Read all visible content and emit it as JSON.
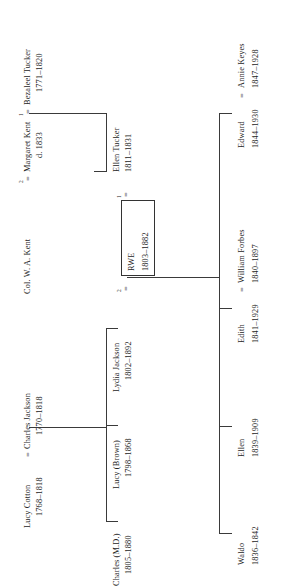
{
  "diagram": {
    "type": "genealogy-chart",
    "orientation": "rotated-90-ccw",
    "line_color": "#3a3a3a",
    "text_color": "#242424"
  },
  "people": {
    "kent": {
      "name": "Col. W. A. Kent",
      "marriage_number": "2",
      "equals": "="
    },
    "margaret_kent": {
      "name": "Margaret Kent",
      "dates": "d. 1833",
      "marriage_number": "1",
      "equals": "="
    },
    "bezaleel_tucker": {
      "name": "Bezaleel Tucker",
      "dates": "1771–1820"
    },
    "ellen_tucker": {
      "name": "Ellen Tucker",
      "dates": "1811–1831"
    },
    "rwe": {
      "name": "RWE",
      "dates": "1803–1882",
      "marriage_1": "1",
      "marriage_2": "2",
      "equals_1": "=",
      "equals_2": "="
    },
    "lucy_cotton": {
      "name": "Lucy Cotton",
      "dates": "1768–1818",
      "equals": "="
    },
    "charles_jackson": {
      "name": "Charles Jackson",
      "dates": "1770–1818"
    },
    "lydia_jackson": {
      "name": "Lydia Jackson",
      "dates": "1802–1892"
    },
    "lucy_brown": {
      "name": "Lucy (Brown)",
      "dates": "1798–1868"
    },
    "charles_md": {
      "name": "Charles (M.D.)",
      "dates": "1805–1880"
    },
    "waldo": {
      "name": "Waldo",
      "dates": "1836–1842"
    },
    "ellen": {
      "name": "Ellen",
      "dates": "1839–1909"
    },
    "edith": {
      "name": "Edith",
      "dates": "1841–1929",
      "equals": "="
    },
    "william_forbes": {
      "name": "William Forbes",
      "dates": "1840–1897"
    },
    "edward": {
      "name": "Edward",
      "dates": "1844–1930",
      "equals": "="
    },
    "annie_keyes": {
      "name": "Annie Keyes",
      "dates": "1847–1928"
    }
  }
}
